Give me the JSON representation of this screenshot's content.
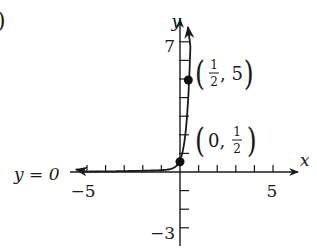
{
  "panel_label_fragment": ")",
  "chart_data": {
    "type": "line",
    "title": "",
    "function": "f(x) = (1/2)·100^x",
    "xlabel": "x",
    "ylabel": "y",
    "xlim": [
      -5.9,
      6.4
    ],
    "ylim": [
      -4,
      8.3
    ],
    "x_ticks": [
      -5,
      -4,
      -3,
      -2,
      -1,
      1,
      2,
      3,
      4,
      5
    ],
    "y_ticks": [
      -3,
      -2,
      -1,
      1,
      2,
      3,
      4,
      5,
      6,
      7
    ],
    "x_tick_labels": [
      {
        "value": -5,
        "text": "−5"
      },
      {
        "value": 5,
        "text": "5"
      }
    ],
    "y_tick_labels": [
      {
        "value": 7,
        "text": "7"
      },
      {
        "value": -3,
        "text": "−3"
      }
    ],
    "grid": false,
    "asymptote": {
      "label": "y = 0",
      "y": 0
    },
    "series": [
      {
        "name": "exponential curve",
        "x": [
          -5.9,
          -4,
          -3,
          -2,
          -1,
          -0.5,
          -0.25,
          0,
          0.1,
          0.2,
          0.3,
          0.4,
          0.45,
          0.5,
          0.55
        ],
        "y": [
          0.0,
          0.0,
          0.0,
          0.0,
          0.005,
          0.05,
          0.16,
          0.5,
          0.79,
          1.26,
          2.0,
          3.15,
          3.97,
          5.0,
          6.3
        ]
      }
    ],
    "annotations": [
      {
        "point": [
          0,
          0.5
        ],
        "text_main": "0,",
        "frac_num": "1",
        "frac_den": "2",
        "label": "(0, 1/2)"
      },
      {
        "point": [
          0.5,
          5
        ],
        "frac_num": "1",
        "frac_den": "2",
        "text_tail": ", 5",
        "label": "(1/2, 5)"
      }
    ]
  },
  "labels": {
    "x_axis": "x",
    "y_axis": "y",
    "asymptote_text": "y = 0",
    "x_min_label": "−5",
    "x_max_label": "5",
    "y_max_label": "7",
    "y_min_label": "−3",
    "point_top": {
      "num": "1",
      "den": "2",
      "tail": ", 5"
    },
    "point_bottom": {
      "head": "0, ",
      "num": "1",
      "den": "2"
    }
  }
}
